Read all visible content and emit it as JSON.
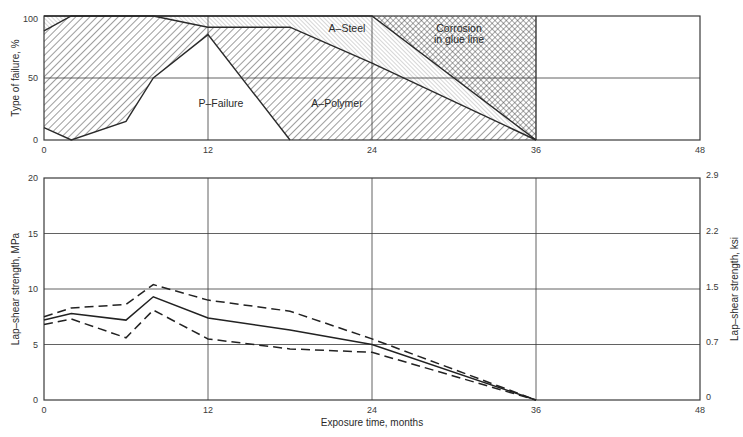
{
  "chart_data": [
    {
      "type": "area",
      "title": "",
      "xlabel": "",
      "ylabel": "Type of failure, %",
      "xlim": [
        0,
        48
      ],
      "ylim": [
        0,
        100
      ],
      "xticks": [
        "0",
        "12",
        "24",
        "36",
        "48"
      ],
      "yticks": [
        "0",
        "50",
        "100"
      ],
      "grid": true,
      "regions": [
        {
          "name": "P-Failure",
          "label": "P–Failure",
          "pattern": "none",
          "upper_boundary": [
            [
              0,
              10
            ],
            [
              2,
              0
            ],
            [
              6,
              15
            ],
            [
              8,
              50
            ],
            [
              12,
              85
            ],
            [
              18,
              0
            ]
          ]
        },
        {
          "name": "A-Polymer",
          "label": "A–Polymer",
          "pattern": "hatch-diagonal-wide",
          "upper_boundary": [
            [
              0,
              88
            ],
            [
              2,
              100
            ],
            [
              8,
              100
            ],
            [
              12,
              91
            ],
            [
              18,
              91
            ],
            [
              24,
              62
            ],
            [
              36,
              0
            ]
          ]
        },
        {
          "name": "A-Steel",
          "label": "A–Steel",
          "pattern": "hatch-diagonal-fine-light",
          "upper_boundary": [
            [
              0,
              100
            ],
            [
              24,
              100
            ],
            [
              36,
              0
            ]
          ]
        },
        {
          "name": "Corrosion in glue line",
          "label_lines": [
            "Corrosion",
            "in glue line"
          ],
          "pattern": "cross-hatch",
          "upper_boundary": [
            [
              24,
              100
            ],
            [
              36,
              100
            ],
            [
              36,
              0
            ]
          ]
        }
      ]
    },
    {
      "type": "line",
      "title": "",
      "xlabel": "Exposure time, months",
      "ylabel": "Lap–shear strength, MPa",
      "ylabel_right": "Lap–shear strength, ksi",
      "xlim": [
        0,
        48
      ],
      "ylim": [
        0,
        20
      ],
      "xticks": [
        "0",
        "12",
        "24",
        "36",
        "48"
      ],
      "yticks": [
        "0",
        "5",
        "10",
        "15",
        "20"
      ],
      "yticks_right": [
        "0",
        "0.7",
        "1.5",
        "2.2",
        "2.9"
      ],
      "grid": true,
      "series": [
        {
          "name": "upper bound",
          "style": "dashed",
          "x": [
            0,
            2,
            6,
            8,
            12,
            18,
            24,
            36
          ],
          "y": [
            7.5,
            8.3,
            8.6,
            10.4,
            9.0,
            8.0,
            5.5,
            0
          ]
        },
        {
          "name": "mean",
          "style": "solid",
          "x": [
            0,
            2,
            6,
            8,
            12,
            18,
            24,
            36
          ],
          "y": [
            7.2,
            7.8,
            7.2,
            9.3,
            7.4,
            6.3,
            5.0,
            0
          ]
        },
        {
          "name": "lower bound",
          "style": "dashed",
          "x": [
            0,
            2,
            6,
            8,
            12,
            18,
            24,
            36
          ],
          "y": [
            6.8,
            7.3,
            5.6,
            8.1,
            5.5,
            4.6,
            4.3,
            0
          ]
        }
      ]
    }
  ],
  "labels": {
    "top_ylabel": "Type of failure, %",
    "bottom_ylabel_left": "Lap–shear strength, MPa",
    "bottom_ylabel_right": "Lap–shear strength, ksi",
    "xlabel": "Exposure time, months",
    "p_failure": "P–Failure",
    "a_polymer": "A–Polymer",
    "a_steel": "A–Steel",
    "corrosion_1": "Corrosion",
    "corrosion_2": "in glue line"
  },
  "ticks": {
    "x": [
      "0",
      "12",
      "24",
      "36",
      "48"
    ],
    "top_y": [
      "0",
      "50",
      "100"
    ],
    "bottom_y_left": [
      "0",
      "5",
      "10",
      "15",
      "20"
    ],
    "bottom_y_right": [
      "0",
      "0.7",
      "1.5",
      "2.2",
      "2.9"
    ]
  },
  "colors": {
    "ink": "#2a2a2a",
    "grid": "#4a4a4a",
    "hatch": "#3c3c3c"
  }
}
